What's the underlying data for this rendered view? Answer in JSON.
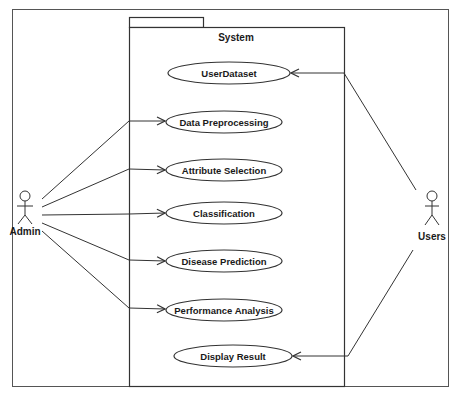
{
  "diagram": {
    "type": "uml-use-case",
    "system": {
      "label": "System"
    },
    "actors": [
      {
        "id": "admin",
        "label": "Admin"
      },
      {
        "id": "users",
        "label": "Users"
      }
    ],
    "use_cases": [
      {
        "id": "uc1",
        "label": "UserDataset"
      },
      {
        "id": "uc2",
        "label": "Data Preprocessing"
      },
      {
        "id": "uc3",
        "label": "Attribute Selection"
      },
      {
        "id": "uc4",
        "label": "Classification"
      },
      {
        "id": "uc5",
        "label": "Disease Prediction"
      },
      {
        "id": "uc6",
        "label": "Performance Analysis"
      },
      {
        "id": "uc7",
        "label": "Display Result"
      }
    ],
    "associations": [
      {
        "from": "admin",
        "to": "uc2"
      },
      {
        "from": "admin",
        "to": "uc3"
      },
      {
        "from": "admin",
        "to": "uc4"
      },
      {
        "from": "admin",
        "to": "uc5"
      },
      {
        "from": "admin",
        "to": "uc6"
      },
      {
        "from": "users",
        "to": "uc1"
      },
      {
        "from": "users",
        "to": "uc7"
      }
    ],
    "colors": {
      "line": "#333333",
      "background": "#ffffff"
    }
  }
}
